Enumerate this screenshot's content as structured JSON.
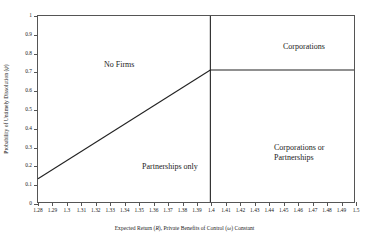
{
  "chart_data": {
    "type": "line",
    "title": "",
    "xlabel": "Expected Return (R),  Private Benefits of Control (ω) Constant",
    "ylabel": "Probability of Untimely Dissolution (ψ)",
    "xlim": [
      1.28,
      1.5
    ],
    "ylim": [
      0,
      1
    ],
    "grid": false,
    "legend_position": "none",
    "xticks": [
      "1.28",
      "1.29",
      "1.3",
      "1.31",
      "1.32",
      "1.33",
      "1.34",
      "1.35",
      "1.36",
      "1.37",
      "1.38",
      "1.39",
      "1.4",
      "1.41",
      "1.42",
      "1.43",
      "1.44",
      "1.45",
      "1.46",
      "1.47",
      "1.48",
      "1.49",
      "1.5"
    ],
    "xtick_values": [
      1.28,
      1.29,
      1.3,
      1.31,
      1.32,
      1.33,
      1.34,
      1.35,
      1.36,
      1.37,
      1.38,
      1.39,
      1.4,
      1.41,
      1.42,
      1.43,
      1.44,
      1.45,
      1.46,
      1.47,
      1.48,
      1.49,
      1.5
    ],
    "yticks": [
      "0",
      "0.1",
      "0.2",
      "0.3",
      "0.4",
      "0.5",
      "0.6",
      "0.7",
      "0.8",
      "0.9",
      "1"
    ],
    "ytick_values": [
      0,
      0.1,
      0.2,
      0.3,
      0.4,
      0.5,
      0.6,
      0.7,
      0.8,
      0.9,
      1
    ],
    "series": [
      {
        "name": "partnership-boundary",
        "type": "line",
        "x": [
          1.28,
          1.4
        ],
        "values": [
          0.125,
          0.71
        ]
      },
      {
        "name": "corporation-threshold-vertical",
        "type": "line",
        "x": [
          1.4,
          1.4
        ],
        "values": [
          0,
          1
        ]
      },
      {
        "name": "corporation-boundary-horizontal",
        "type": "line",
        "x": [
          1.4,
          1.5
        ],
        "values": [
          0.71,
          0.71
        ]
      }
    ],
    "annotations": [
      {
        "name": "no-firms",
        "text": "No Firms",
        "x": 1.315,
        "y": 0.82
      },
      {
        "name": "corporations",
        "text": "Corporations",
        "x": 1.447,
        "y": 0.915
      },
      {
        "name": "partnerships-only",
        "text": "Partnerships only",
        "x": 1.353,
        "y": 0.3
      },
      {
        "name": "corporations-or-partnerships",
        "text": "Corporations or\nPartnerships",
        "x": 1.44,
        "y": 0.4
      }
    ]
  },
  "axis": {
    "x_title_prefix": "Expected Return (",
    "x_title_sym1": "R",
    "x_title_mid": "),  Private Benefits of Control (",
    "x_title_sym2": "ω",
    "x_title_suffix": ") Constant",
    "y_title_prefix": "Probability of Untimely Dissolution (",
    "y_title_sym": "ψ",
    "y_title_suffix": ")"
  },
  "regions": {
    "no_firms": "No Firms",
    "corporations": "Corporations",
    "partnerships_only": "Partnerships only",
    "corporations_or_partnerships": "Corporations or\nPartnerships"
  },
  "colors": {
    "line": "#222222",
    "axis": "#555555",
    "text": "#1a1a1a",
    "background": "#ffffff"
  }
}
